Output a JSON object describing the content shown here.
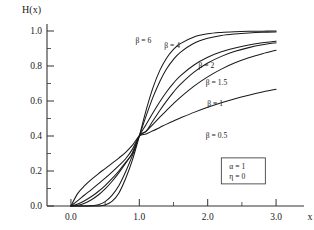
{
  "chart_data": {
    "type": "line",
    "title": "",
    "xlabel": "x",
    "ylabel": "H(x)",
    "xlim": [
      -0.35,
      3.35
    ],
    "ylim": [
      0.0,
      1.04
    ],
    "grid": false,
    "legend_position": "inline-curve-labels",
    "xticks": [
      "0.0",
      "1.0",
      "2.0",
      "3.0"
    ],
    "xtick_values": [
      0.0,
      1.0,
      2.0,
      3.0
    ],
    "xminor_values": [
      0.5,
      1.5,
      2.5
    ],
    "yticks": [
      "0.0",
      "0.2",
      "0.4",
      "0.6",
      "0.8",
      "1.0"
    ],
    "ytick_values": [
      0.0,
      0.2,
      0.4,
      0.6,
      0.8,
      1.0
    ],
    "yminor_values": [
      0.1,
      0.3,
      0.5,
      0.7,
      0.9
    ],
    "crossing_point": [
      1.0,
      0.4
    ],
    "annotations": [
      {
        "name": "alpha",
        "text": "α = 1"
      },
      {
        "name": "eta",
        "text": "η = 0"
      }
    ],
    "x": [
      0.0,
      0.1,
      0.2,
      0.3,
      0.4,
      0.5,
      0.6,
      0.7,
      0.8,
      0.9,
      1.0,
      1.1,
      1.2,
      1.3,
      1.4,
      1.5,
      1.6,
      1.8,
      2.0,
      2.2,
      2.4,
      2.6,
      2.8,
      3.0
    ],
    "series": [
      {
        "name": "beta-6",
        "label": "β = 6",
        "beta": 6,
        "label_x": 1.06,
        "label_y": 0.945,
        "values": [
          0.0,
          0.0,
          0.0,
          0.0,
          0.0,
          0.006,
          0.026,
          0.073,
          0.157,
          0.264,
          0.4,
          0.548,
          0.676,
          0.775,
          0.846,
          0.895,
          0.928,
          0.966,
          0.984,
          0.992,
          0.996,
          0.998,
          0.999,
          1.0
        ]
      },
      {
        "name": "beta-4",
        "label": "β = 4",
        "beta": 4,
        "label_x": 1.48,
        "label_y": 0.915,
        "values": [
          0.0,
          0.0,
          0.0,
          0.001,
          0.007,
          0.025,
          0.061,
          0.116,
          0.196,
          0.289,
          0.4,
          0.515,
          0.622,
          0.712,
          0.784,
          0.838,
          0.878,
          0.93,
          0.958,
          0.974,
          0.983,
          0.989,
          0.993,
          0.995
        ]
      },
      {
        "name": "beta-2",
        "label": "β = 2",
        "beta": 2,
        "label_x": 1.98,
        "label_y": 0.805,
        "values": [
          0.0,
          0.004,
          0.016,
          0.036,
          0.063,
          0.098,
          0.14,
          0.189,
          0.244,
          0.305,
          0.4,
          0.466,
          0.533,
          0.596,
          0.653,
          0.702,
          0.744,
          0.806,
          0.85,
          0.881,
          0.903,
          0.92,
          0.933,
          0.942
        ]
      },
      {
        "name": "beta-1.5",
        "label": "β = 1.5",
        "beta": 1.5,
        "label_x": 2.13,
        "label_y": 0.705,
        "values": [
          0.0,
          0.011,
          0.03,
          0.054,
          0.083,
          0.117,
          0.156,
          0.2,
          0.249,
          0.302,
          0.4,
          0.427,
          0.487,
          0.546,
          0.601,
          0.651,
          0.695,
          0.765,
          0.817,
          0.855,
          0.884,
          0.905,
          0.921,
          0.933
        ]
      },
      {
        "name": "beta-1",
        "label": "β = 1",
        "beta": 1,
        "label_x": 2.11,
        "label_y": 0.585,
        "values": [
          0.0,
          0.031,
          0.063,
          0.094,
          0.126,
          0.159,
          0.194,
          0.231,
          0.27,
          0.325,
          0.4,
          0.428,
          0.467,
          0.508,
          0.547,
          0.585,
          0.621,
          0.685,
          0.738,
          0.782,
          0.818,
          0.847,
          0.87,
          0.89
        ]
      },
      {
        "name": "beta-0.5",
        "label": "β = 0.5",
        "beta": 0.5,
        "label_x": 2.13,
        "label_y": 0.405,
        "values": [
          0.0,
          0.072,
          0.116,
          0.152,
          0.184,
          0.214,
          0.244,
          0.274,
          0.307,
          0.348,
          0.4,
          0.412,
          0.43,
          0.449,
          0.468,
          0.486,
          0.503,
          0.535,
          0.564,
          0.59,
          0.613,
          0.633,
          0.651,
          0.667
        ]
      }
    ]
  }
}
